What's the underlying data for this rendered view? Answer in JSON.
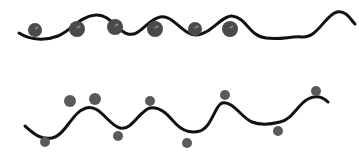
{
  "title": "Two wavy lines with dots",
  "colors": {
    "background": "#ffffff",
    "line": "#111111",
    "dot_top": "#4a4a4a",
    "dot_top_highlight": "#8a8a8a",
    "dot_bottom": "#5a5a5a"
  },
  "panels": [
    {
      "name": "top-wave",
      "description": "Wavy line with large dots resting in the troughs",
      "line_width": 3,
      "path": "M19,33 C30,40 45,41 58,36 C72,30 80,16 96,15 C110,14 118,32 128,34 C140,37 147,20 160,17 C173,14 182,35 196,35 C210,35 222,15 232,16 C246,17 250,37 266,38 C282,40 290,36 302,37 C318,38 325,15 337,12 C346,10 351,20 355,24",
      "dots": [
        {
          "cx": 35,
          "cy": 30,
          "r": 7
        },
        {
          "cx": 77,
          "cy": 29,
          "r": 8
        },
        {
          "cx": 115,
          "cy": 27,
          "r": 8
        },
        {
          "cx": 155,
          "cy": 29,
          "r": 8
        },
        {
          "cx": 195,
          "cy": 29,
          "r": 7
        },
        {
          "cx": 230,
          "cy": 29,
          "r": 8
        }
      ]
    },
    {
      "name": "bottom-wave",
      "description": "Wavy line with small dots alternately above peaks and below troughs",
      "line_width": 3,
      "path": "M25,126 C33,133 40,140 52,138 C65,136 72,112 86,108 C100,104 108,125 120,128 C132,131 140,110 150,108 C162,106 170,118 176,124 C182,130 190,134 200,131 C212,127 215,105 222,103 C232,100 242,118 252,122 C262,126 272,124 280,122 C292,120 298,104 308,99 C318,94 324,98 328,102",
      "dots": [
        {
          "cx": 70,
          "cy": 101,
          "r": 6,
          "position": "above"
        },
        {
          "cx": 95,
          "cy": 99,
          "r": 6,
          "position": "above"
        },
        {
          "cx": 45,
          "cy": 142,
          "r": 5,
          "position": "below"
        },
        {
          "cx": 118,
          "cy": 136,
          "r": 5,
          "position": "below"
        },
        {
          "cx": 150,
          "cy": 101,
          "r": 5,
          "position": "above"
        },
        {
          "cx": 187,
          "cy": 143,
          "r": 5,
          "position": "below"
        },
        {
          "cx": 225,
          "cy": 95,
          "r": 5,
          "position": "above"
        },
        {
          "cx": 278,
          "cy": 131,
          "r": 5,
          "position": "below"
        },
        {
          "cx": 316,
          "cy": 91,
          "r": 5,
          "position": "above"
        }
      ]
    }
  ]
}
